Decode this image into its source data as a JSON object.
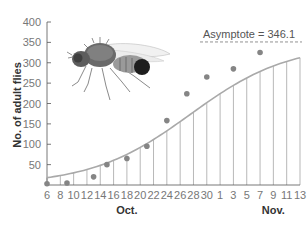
{
  "chart_data": {
    "type": "scatter",
    "title": "",
    "xlabel": "",
    "ylabel": "No. of adult flies",
    "ylim": [
      0,
      400
    ],
    "yticks": [
      50,
      100,
      150,
      200,
      250,
      300,
      350,
      400
    ],
    "x_tick_labels": [
      "6",
      "8",
      "10",
      "12",
      "14",
      "16",
      "18",
      "20",
      "22",
      "24",
      "26",
      "28",
      "30",
      "1",
      "3",
      "5",
      "7",
      "9",
      "11",
      "13"
    ],
    "x_group_labels": [
      {
        "label": "Oct.",
        "center_tick_index": 6
      },
      {
        "label": "Nov.",
        "center_tick_index": 17
      }
    ],
    "grid": "vertical lines from curve to x-axis at each tick",
    "series": [
      {
        "name": "Observed counts",
        "kind": "points",
        "x_day_index": [
          0,
          3,
          7,
          9,
          12,
          15,
          18,
          21,
          24,
          28,
          32
        ],
        "x_dates": [
          "Oct 6",
          "Oct 9",
          "Oct 13",
          "Oct 15",
          "Oct 18",
          "Oct 21",
          "Oct 24",
          "Oct 27",
          "Oct 30",
          "Nov 3",
          "Nov 7"
        ],
        "values": [
          3,
          5,
          20,
          50,
          65,
          95,
          158,
          224,
          265,
          285,
          325
        ]
      },
      {
        "name": "Logistic fit",
        "kind": "curve",
        "asymptote": 346.1
      }
    ],
    "annotations": [
      {
        "text": "Asymptote = 346.1",
        "style": "dashed line"
      }
    ],
    "legend": "none"
  },
  "labels": {
    "ylabel": "No. of adult flies",
    "asymptote": "Asymptote = 346.1",
    "oct": "Oct.",
    "nov": "Nov."
  },
  "image": {
    "subject": "fruit-fly-illustration"
  },
  "colors": {
    "curve": "#a0a0a0",
    "points": "#808080",
    "axis": "#555555",
    "grid": "#999999",
    "text": "#777777"
  }
}
